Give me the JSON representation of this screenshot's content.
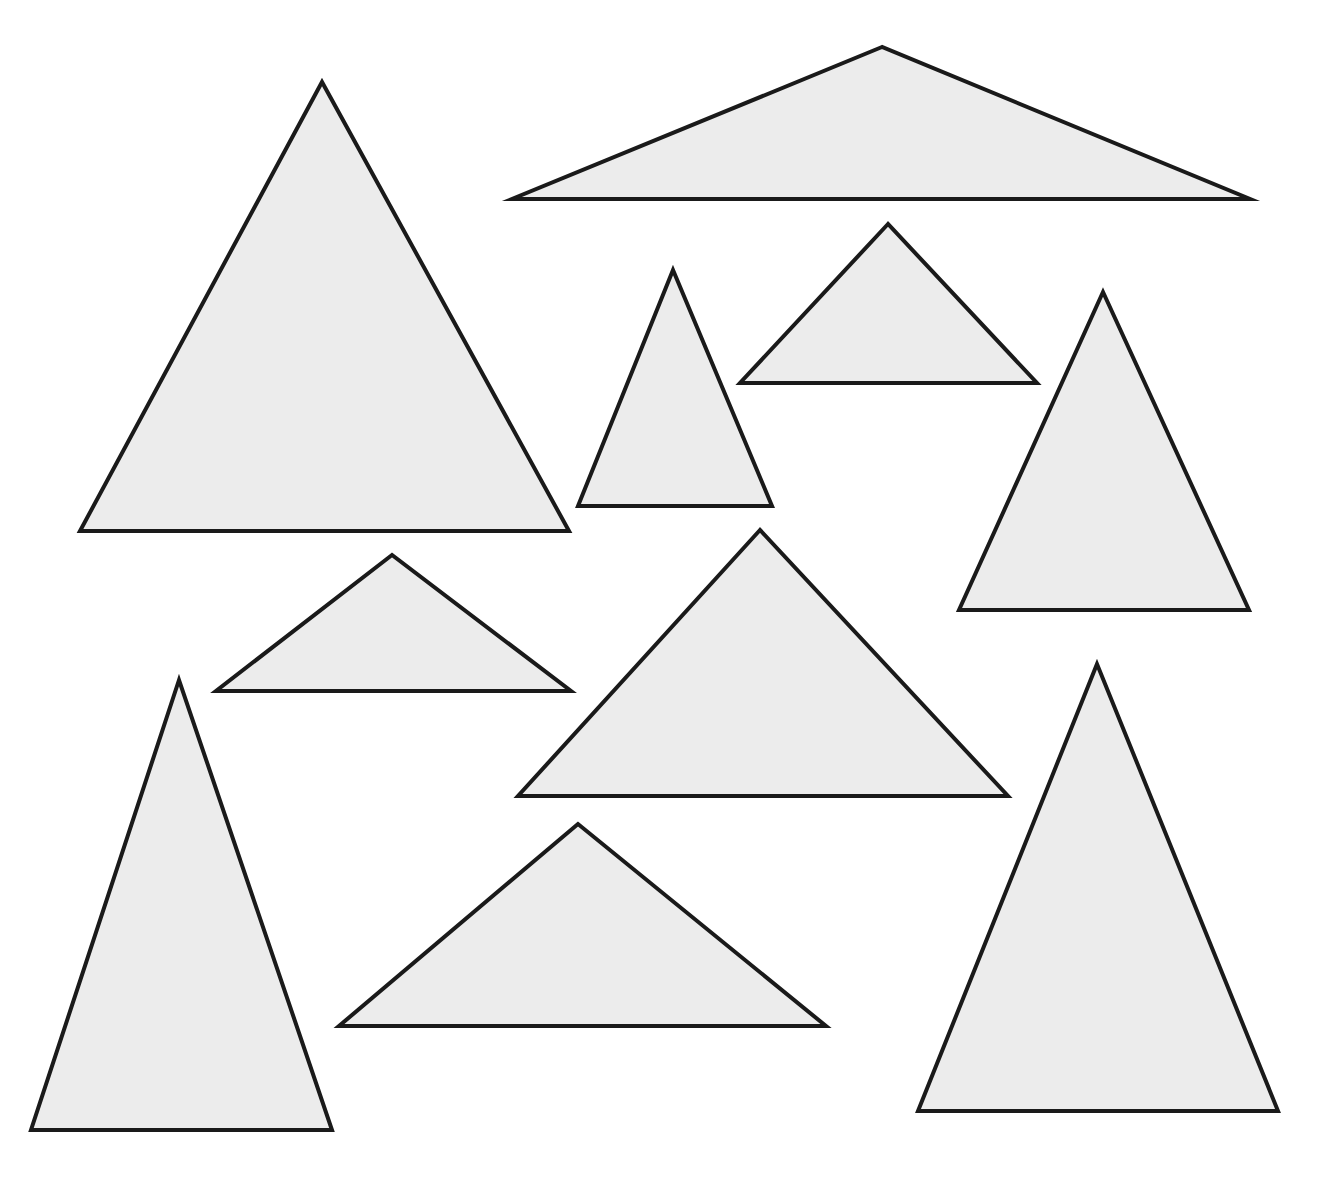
{
  "canvas": {
    "width": 1325,
    "height": 1177,
    "background": "#ffffff"
  },
  "style": {
    "fill": "#ececec",
    "stroke": "#1a1a1a",
    "stroke_width": 4
  },
  "triangles": [
    {
      "id": "large-equilateral-left",
      "points": [
        [
          322,
          82
        ],
        [
          80,
          531
        ],
        [
          569,
          531
        ]
      ]
    },
    {
      "id": "wide-obtuse-top",
      "points": [
        [
          882,
          47
        ],
        [
          512,
          199
        ],
        [
          1250,
          199
        ]
      ]
    },
    {
      "id": "narrow-acute-center",
      "points": [
        [
          673,
          270
        ],
        [
          578,
          506
        ],
        [
          772,
          506
        ]
      ]
    },
    {
      "id": "right-angle-small-top",
      "points": [
        [
          888,
          224
        ],
        [
          740,
          383
        ],
        [
          1037,
          383
        ]
      ]
    },
    {
      "id": "tall-isosceles-right-upper",
      "points": [
        [
          1103,
          292
        ],
        [
          959,
          610
        ],
        [
          1249,
          610
        ]
      ]
    },
    {
      "id": "small-obtuse-left-middle",
      "points": [
        [
          392,
          555
        ],
        [
          216,
          691
        ],
        [
          571,
          691
        ]
      ]
    },
    {
      "id": "large-right-angle-center",
      "points": [
        [
          760,
          530
        ],
        [
          518,
          796
        ],
        [
          1008,
          796
        ]
      ]
    },
    {
      "id": "tall-narrow-left-bottom",
      "points": [
        [
          179,
          680
        ],
        [
          31,
          1130
        ],
        [
          332,
          1130
        ]
      ]
    },
    {
      "id": "obtuse-bottom-center",
      "points": [
        [
          578,
          824
        ],
        [
          339,
          1026
        ],
        [
          826,
          1026
        ]
      ]
    },
    {
      "id": "tall-isosceles-right-bottom",
      "points": [
        [
          1097,
          664
        ],
        [
          918,
          1111
        ],
        [
          1278,
          1111
        ]
      ]
    }
  ]
}
